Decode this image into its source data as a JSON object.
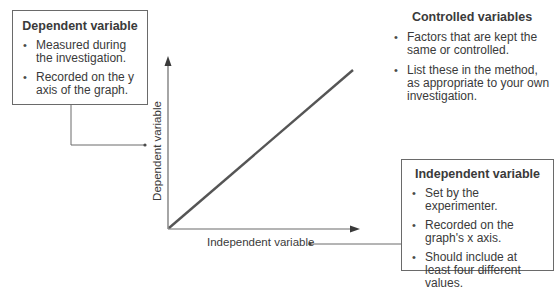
{
  "dependent_box": {
    "title": "Dependent variable",
    "bullets": [
      "Measured during the investigation.",
      "Recorded on the y axis of the graph."
    ]
  },
  "controlled_block": {
    "title": "Controlled variables",
    "bullets": [
      "Factors that are kept the same or controlled.",
      "List these in the method, as appropriate to your own investigation."
    ]
  },
  "independent_box": {
    "title": "Independent variable",
    "bullets": [
      "Set by the experimenter.",
      "Recorded on the graph's x axis.",
      "Should include at least four different values."
    ]
  },
  "graph": {
    "y_axis_label": "Dependent variable",
    "x_axis_label": "Independent variable",
    "line_description": "straight line through the origin with positive slope"
  },
  "colors": {
    "line": "#555555",
    "axis": "#6a6a6a",
    "text": "#3a3a3a",
    "background": "#ffffff"
  }
}
